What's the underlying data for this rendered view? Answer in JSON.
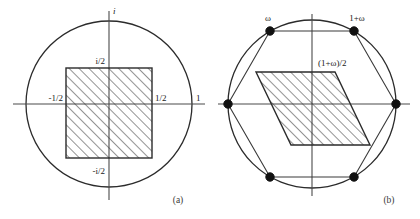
{
  "figure": {
    "background_color": "#ffffff",
    "ink_color": "#2b2b2b",
    "panels": [
      {
        "id": "panel-a",
        "caption": "(a)",
        "center": {
          "x": 109,
          "y": 104
        },
        "circle_radius": 83,
        "axis_labels": {
          "imaginary_top": "i",
          "imaginary_half_positive": "i/2",
          "imaginary_half_negative": "-i/2",
          "real_half_negative": "-1/2",
          "real_half_positive": "1/2",
          "real_unit": "1"
        },
        "region": {
          "type": "square",
          "hatch_angle_degrees": 45,
          "corners": [
            {
              "x": 66,
              "y": 68
            },
            {
              "x": 152,
              "y": 68
            },
            {
              "x": 152,
              "y": 158
            },
            {
              "x": 66,
              "y": 158
            }
          ]
        }
      },
      {
        "id": "panel-b",
        "caption": "(b)",
        "center": {
          "x": 312,
          "y": 104
        },
        "circle_radius": 84,
        "vertex_labels": {
          "omega": "ω",
          "one_plus_omega": "1+ω",
          "half_one_plus_omega": "(1+ω)/2"
        },
        "hexagon_vertices": [
          {
            "x": 396,
            "y": 104
          },
          {
            "x": 354,
            "y": 31
          },
          {
            "x": 270,
            "y": 31
          },
          {
            "x": 228,
            "y": 104
          },
          {
            "x": 270,
            "y": 177
          },
          {
            "x": 354,
            "y": 177
          }
        ],
        "marked_vertices": [
          {
            "x": 396,
            "y": 104
          },
          {
            "x": 354,
            "y": 31
          },
          {
            "x": 270,
            "y": 31
          },
          {
            "x": 228,
            "y": 104
          },
          {
            "x": 270,
            "y": 177
          },
          {
            "x": 354,
            "y": 177
          }
        ],
        "region": {
          "type": "parallelogram",
          "hatch_angle_degrees": 45,
          "corners": [
            {
              "x": 256,
              "y": 72
            },
            {
              "x": 335,
              "y": 72
            },
            {
              "x": 370,
              "y": 145
            },
            {
              "x": 291,
              "y": 145
            }
          ]
        }
      }
    ]
  },
  "labels": {
    "panel_a": {
      "i": "i",
      "i_half": "i/2",
      "neg_i_half": "-i/2",
      "neg_half": "-1/2",
      "half": "1/2",
      "one": "1",
      "caption": "(a)"
    },
    "panel_b": {
      "omega": "ω",
      "one_plus_omega": "1+ω",
      "half_one_plus_omega": "(1+ω)/2",
      "caption": "(b)"
    }
  }
}
